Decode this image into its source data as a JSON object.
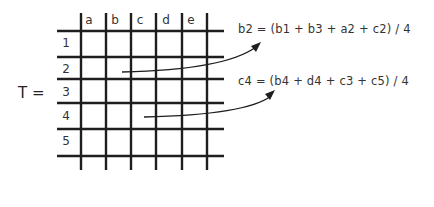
{
  "matrix": {
    "name_label": "T =",
    "column_headers": [
      "a",
      "b",
      "c",
      "d",
      "e"
    ],
    "row_headers": [
      "1",
      "2",
      "3",
      "4",
      "5"
    ]
  },
  "formulas": [
    {
      "text": "b2 = (b1 + b3 + a2 + c2) / 4",
      "source_cell": "b2"
    },
    {
      "text": "c4 = (b4 + d4 + c3 + c5) / 4",
      "source_cell": "c4"
    }
  ],
  "colors": {
    "line": "#1e1e1e",
    "text": "#333333",
    "background": "#ffffff"
  }
}
